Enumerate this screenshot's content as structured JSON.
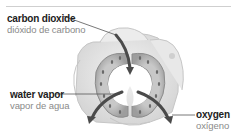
{
  "diagram": {
    "labels": [
      {
        "id": "carbon_dioxide",
        "en": "carbon dioxide",
        "es": "dióxido de carbono"
      },
      {
        "id": "water_vapor",
        "en": "water vapor",
        "es": "vapor de agua"
      },
      {
        "id": "oxygen",
        "en": "oxygen",
        "es": "oxígeno"
      }
    ],
    "colors": {
      "arrow": "#4a4a4a",
      "guard_cell": "#b9b9b9",
      "epidermal_cell": "#e6e6e6",
      "leader_line": "#555555"
    }
  }
}
